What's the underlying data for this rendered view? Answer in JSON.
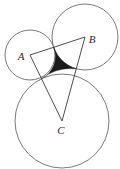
{
  "figure": {
    "background_color": "#ffffff",
    "circle_stroke_color": "#6b6b6b",
    "triangle_stroke_color": "#3a3a3a",
    "shaded_region_color": "#1a1a1a",
    "canvas": {
      "width": 120,
      "height": 169
    },
    "labels": {
      "a": "A",
      "b": "B",
      "c": "C"
    },
    "label_positions": {
      "a": {
        "x": 21,
        "y": 57
      },
      "b": {
        "x": 92,
        "y": 40
      },
      "c": {
        "x": 61,
        "y": 131
      }
    },
    "circles": [
      {
        "name": "circle-a",
        "label": "A",
        "cx": 30,
        "cy": 55,
        "r": 25
      },
      {
        "name": "circle-b",
        "label": "B",
        "cx": 85,
        "cy": 37,
        "r": 33
      },
      {
        "name": "circle-c",
        "label": "C",
        "cx": 62,
        "cy": 121,
        "r": 47
      }
    ],
    "triangle": {
      "name": "center-triangle",
      "vertices": [
        {
          "label": "A",
          "x": 30,
          "y": 55
        },
        {
          "label": "B",
          "x": 85,
          "y": 37
        },
        {
          "label": "C",
          "x": 62,
          "y": 121
        }
      ]
    },
    "tangency_points": [
      {
        "between": "A-B",
        "x": 53.7,
        "y": 47.7
      },
      {
        "between": "B-C",
        "x": 75.5,
        "y": 72.2
      },
      {
        "between": "A-C",
        "x": 43.1,
        "y": 77.0
      }
    ],
    "shaded_region": {
      "name": "curvilinear-triangle",
      "description": "concave curvilinear triangle bounded by the three mutually tangent arcs",
      "fill": "#1a1a1a"
    }
  }
}
